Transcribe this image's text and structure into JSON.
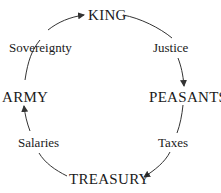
{
  "diagram": {
    "type": "cycle",
    "nodes": {
      "king": "KING",
      "peasants": "PEASANTS",
      "treasury": "TREASURY",
      "army": "ARMY"
    },
    "edges": {
      "king_to_peasants": "Justice",
      "peasants_to_treasury": "Taxes",
      "treasury_to_army": "Salaries",
      "army_to_king": "Sovereignty"
    },
    "edge_color": "#333333"
  }
}
